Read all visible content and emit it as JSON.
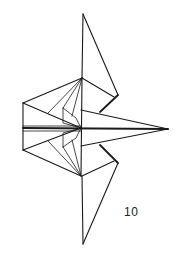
{
  "diagram": {
    "type": "origami-fold-step",
    "step_number": "10",
    "line_color": "#1a1a1a",
    "background": "#ffffff"
  }
}
